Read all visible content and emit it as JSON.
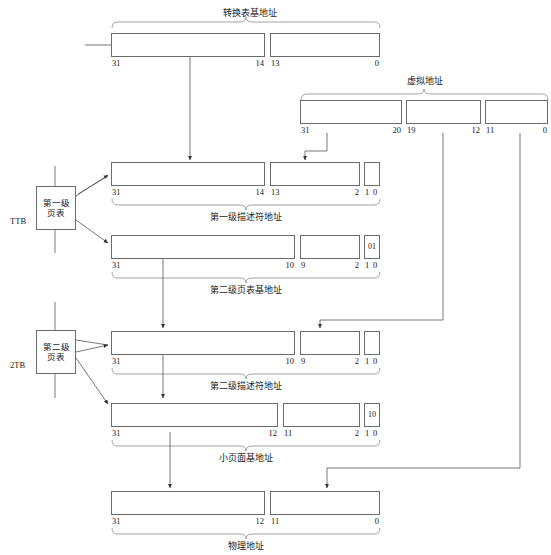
{
  "diagram": {
    "title_top": "转换表基地址",
    "label_virtual": "虚拟地址",
    "label_l1_desc": "第一级描述符地址",
    "label_l2_base": "第二级页表基地址",
    "label_l2_desc": "第二级描述符地址",
    "label_small_page": "小页面基地址",
    "label_physical": "物理地址"
  },
  "rows": {
    "ttb_base": {
      "fields": [
        {
          "left": "31",
          "right": "14"
        },
        {
          "left": "13",
          "right": "0"
        }
      ]
    },
    "virtual_address": {
      "fields": [
        {
          "left": "31",
          "right": "20"
        },
        {
          "left": "19",
          "right": "12"
        },
        {
          "left": "11",
          "right": "0"
        }
      ]
    },
    "l1_descriptor_address": {
      "fields": [
        {
          "left": "31",
          "right": "14"
        },
        {
          "left": "13",
          "right": "2"
        },
        {
          "left": "1",
          "right": "0"
        }
      ]
    },
    "l2_table_base": {
      "fields": [
        {
          "left": "31",
          "right": "10"
        },
        {
          "left": "9",
          "right": "2"
        },
        {
          "left": "1",
          "right": "0"
        }
      ],
      "flag": "01"
    },
    "l2_descriptor_address": {
      "fields": [
        {
          "left": "31",
          "right": "10"
        },
        {
          "left": "9",
          "right": "2"
        },
        {
          "left": "1",
          "right": "0"
        }
      ]
    },
    "small_page_base": {
      "fields": [
        {
          "left": "31",
          "right": "12"
        },
        {
          "left": "11",
          "right": "2"
        },
        {
          "left": "1",
          "right": "0"
        }
      ],
      "flag": "10"
    },
    "physical_address": {
      "fields": [
        {
          "left": "31",
          "right": "12"
        },
        {
          "left": "11",
          "right": "0"
        }
      ]
    }
  },
  "page_tables": [
    {
      "name": "l1",
      "line1": "第一级",
      "line2": "页表",
      "side_label": "TTB"
    },
    {
      "name": "l2",
      "line1": "第二级",
      "line2": "页表",
      "side_label": "2TB"
    }
  ],
  "colors": {
    "stroke": "#6b6b6b",
    "text": "#1a1a1a",
    "background": "#ffffff"
  }
}
